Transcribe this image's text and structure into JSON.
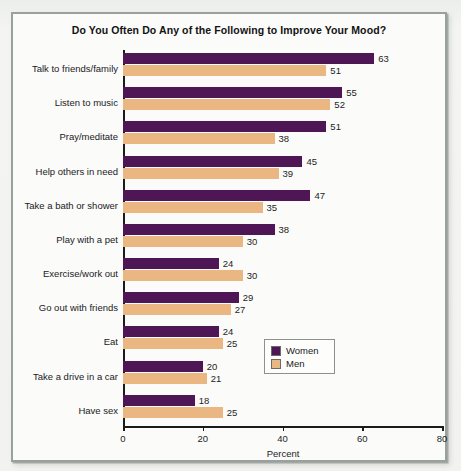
{
  "chart_data": {
    "type": "bar",
    "orientation": "horizontal",
    "title": "Do You Often Do Any of the Following to Improve Your Mood?",
    "xlabel": "Percent",
    "ylabel": "",
    "xlim": [
      0,
      80
    ],
    "xticks": [
      0,
      20,
      40,
      60,
      80
    ],
    "xtick_labels": [
      "0",
      "20",
      "40",
      "60",
      "80"
    ],
    "grid": false,
    "legend_position": "lower right",
    "categories": [
      "Talk to friends/family",
      "Listen to music",
      "Pray/meditate",
      "Help others in need",
      "Take a bath or shower",
      "Play with a pet",
      "Exercise/work out",
      "Go out with friends",
      "Eat",
      "Take a drive in a car",
      "Have sex"
    ],
    "series": [
      {
        "name": "Women",
        "color": "#4e1654",
        "values": [
          63,
          55,
          51,
          45,
          47,
          38,
          24,
          29,
          24,
          20,
          18
        ]
      },
      {
        "name": "Men",
        "color": "#eab682",
        "values": [
          51,
          52,
          38,
          39,
          35,
          30,
          30,
          27,
          25,
          21,
          25
        ]
      }
    ]
  },
  "legend": {
    "items": [
      {
        "label": "Women",
        "color": "#4e1654"
      },
      {
        "label": "Men",
        "color": "#eab682"
      }
    ]
  }
}
